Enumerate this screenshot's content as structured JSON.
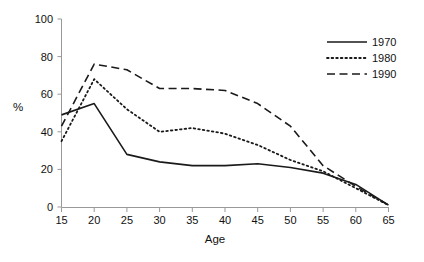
{
  "chart_data": {
    "type": "line",
    "title": "",
    "xlabel": "Age",
    "ylabel": "%",
    "xlim": [
      15,
      65
    ],
    "ylim": [
      0,
      100
    ],
    "xticks": [
      15,
      20,
      25,
      30,
      35,
      40,
      45,
      50,
      55,
      60,
      65
    ],
    "yticks": [
      0,
      20,
      40,
      60,
      80,
      100
    ],
    "grid": false,
    "legend_position": "top-right",
    "x": [
      15,
      20,
      25,
      30,
      35,
      40,
      45,
      50,
      55,
      60,
      65
    ],
    "series": [
      {
        "name": "1970",
        "style": "solid",
        "color": "#1a1a1a",
        "values": [
          49,
          55,
          28,
          24,
          22,
          22,
          23,
          21,
          18,
          12,
          1
        ]
      },
      {
        "name": "1980",
        "style": "dotted",
        "color": "#1a1a1a",
        "values": [
          35,
          68,
          52,
          40,
          42,
          39,
          33,
          25,
          19,
          10,
          1
        ]
      },
      {
        "name": "1990",
        "style": "dashed",
        "color": "#1a1a1a",
        "values": [
          43,
          76,
          73,
          63,
          63,
          62,
          55,
          43,
          22,
          11,
          1
        ]
      }
    ]
  },
  "axis": {
    "x_tick_labels": [
      "15",
      "20",
      "25",
      "30",
      "35",
      "40",
      "45",
      "50",
      "55",
      "60",
      "65"
    ],
    "y_tick_labels": [
      "0",
      "20",
      "40",
      "60",
      "80",
      "100"
    ],
    "x_title": "Age",
    "y_title": "%"
  },
  "legend": {
    "entries": [
      {
        "label": "1970",
        "style": "solid"
      },
      {
        "label": "1980",
        "style": "dotted"
      },
      {
        "label": "1990",
        "style": "dashed"
      }
    ]
  },
  "colors": {
    "line": "#1a1a1a",
    "axis": "#999999",
    "background": "#ffffff"
  }
}
